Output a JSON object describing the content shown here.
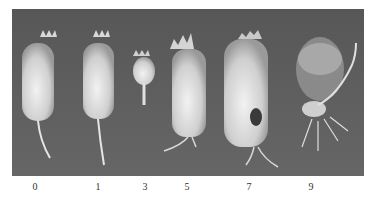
{
  "figure": {
    "background_color": "#5e5e5e",
    "labels": [
      "0",
      "1",
      "3",
      "5",
      "7",
      "9"
    ]
  }
}
